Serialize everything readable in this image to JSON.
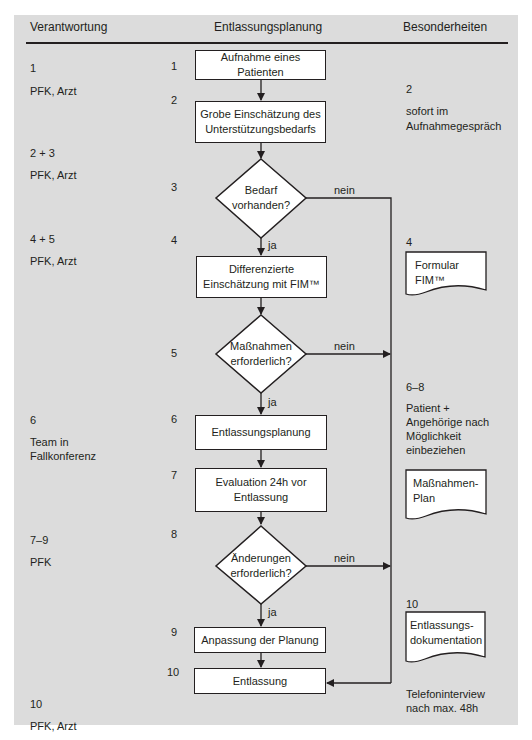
{
  "headers": {
    "left": "Verantwortung",
    "center": "Entlassungsplanung",
    "right": "Besonderheiten"
  },
  "responsibility": [
    {
      "steps": "1",
      "who": "PFK, Arzt"
    },
    {
      "steps": "2 + 3",
      "who": "PFK, Arzt"
    },
    {
      "steps": "4 + 5",
      "who": "PFK, Arzt"
    },
    {
      "steps": "6",
      "who_line1": "Team in",
      "who_line2": "Fallkonferenz"
    },
    {
      "steps": "7–9",
      "who": "PFK"
    },
    {
      "steps": "10",
      "who": "PFK, Arzt"
    }
  ],
  "step_numbers": [
    "1",
    "2",
    "3",
    "4",
    "5",
    "6",
    "7",
    "8",
    "9",
    "10"
  ],
  "flow": {
    "box1": "Aufnahme eines Patienten",
    "box2_line1": "Grobe Einschätzung des",
    "box2_line2": "Unterstützungsbedarfs",
    "decision3_line1": "Bedarf",
    "decision3_line2": "vorhanden?",
    "box4_line1": "Differenzierte",
    "box4_line2": "Einschätzung mit FIM™",
    "decision5_line1": "Maßnahmen",
    "decision5_line2": "erforderlich?",
    "box6": "Entlassungsplanung",
    "box7_line1": "Evaluation 24h vor",
    "box7_line2": "Entlassung",
    "decision8_line1": "Änderungen",
    "decision8_line2": "erforderlich?",
    "box9": "Anpassung der Planung",
    "box10": "Entlassung",
    "yes_label": "ja",
    "no_label": "nein"
  },
  "notes": {
    "n2_num": "2",
    "n2_line1": "sofort im",
    "n2_line2": "Aufnahmegespräch",
    "n4_num": "4",
    "n4_doc_line1": "Formular",
    "n4_doc_line2": "FIM™",
    "n68_num": "6–8",
    "n68_line1": "Patient +",
    "n68_line2": "Angehörige nach",
    "n68_line3": "Möglichkeit",
    "n68_line4": "einbeziehen",
    "n68_doc_line1": "Maßnahmen-",
    "n68_doc_line2": "Plan",
    "n10_num": "10",
    "n10_doc_line1": "Entlassungs-",
    "n10_doc_line2": "dokumentation",
    "n10_line1": "Telefoninterview",
    "n10_line2": "nach max. 48h"
  },
  "colors": {
    "panel": "#dcdcdc",
    "stroke": "#231f20",
    "box_fill": "#ffffff"
  }
}
